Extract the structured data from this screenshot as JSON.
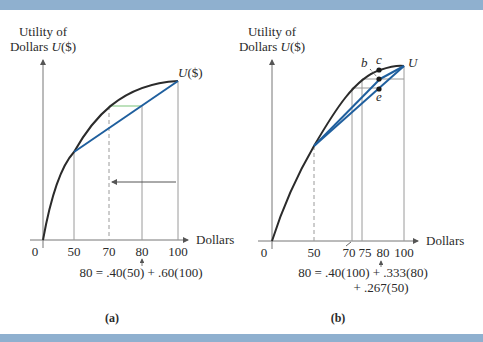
{
  "colors": {
    "band": "#8fb0cf",
    "curve": "#2b2b2b",
    "chord": "#1f5f9e",
    "green": "#7cc47a",
    "guide": "#9a9a9a",
    "text": "#2a2a2a"
  },
  "panel_a": {
    "ylabel_line1": "Utility of",
    "ylabel_line2_prefix": "Dollars ",
    "ylabel_line2_italic": "U",
    "ylabel_line2_suffix": "($)",
    "curve_label_italic": "U",
    "curve_label_suffix": "($)",
    "xlabel": "Dollars",
    "ticks": [
      "0",
      "50",
      "70",
      "80",
      "100"
    ],
    "equation": "80 = .40(50) + .60(100)",
    "caption": "(a)"
  },
  "panel_b": {
    "ylabel_line1": "Utility of",
    "ylabel_line2_prefix": "Dollars ",
    "ylabel_line2_italic": "U",
    "ylabel_line2_suffix": "($)",
    "curve_label": "U",
    "point_labels": {
      "b": "b",
      "c": "c",
      "e": "e"
    },
    "xlabel": "Dollars",
    "ticks": [
      "0",
      "50",
      "70",
      "75",
      "80",
      "100"
    ],
    "equation_line1": "80 = .40(100) + .333(80)",
    "equation_line2": "+ .267(50)",
    "caption": "(b)"
  }
}
